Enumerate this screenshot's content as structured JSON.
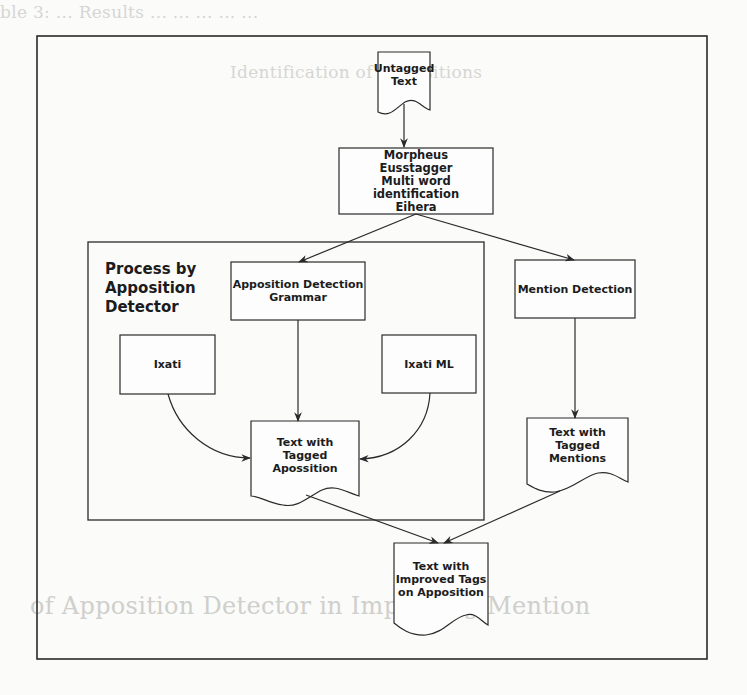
{
  "diagram": {
    "type": "flowchart",
    "nodes": {
      "untagged_text": {
        "shape": "document",
        "label": "Untagged\nText",
        "lines": [
          "Untagged",
          "Text"
        ]
      },
      "preprocessing": {
        "shape": "process",
        "lines": [
          "Morpheus",
          "Eusstagger",
          "Multi word identification",
          "Eihera"
        ]
      },
      "apposition_grammar": {
        "shape": "process",
        "lines": [
          "Apposition Detection",
          "Grammar"
        ]
      },
      "mention_detection": {
        "shape": "process",
        "lines": [
          "Mention Detection"
        ]
      },
      "ixati": {
        "shape": "process",
        "lines": [
          "Ixati"
        ]
      },
      "ixati_ml": {
        "shape": "process",
        "lines": [
          "Ixati ML"
        ]
      },
      "tagged_apposition": {
        "shape": "document",
        "lines": [
          "Text with",
          "Tagged Apossition"
        ]
      },
      "tagged_mentions": {
        "shape": "document",
        "lines": [
          "Text with",
          "Tagged",
          "Mentions"
        ]
      },
      "improved_tags": {
        "shape": "document",
        "lines": [
          "Text with",
          "Improved Tags",
          "on Apposition"
        ]
      }
    },
    "group": {
      "title_lines": [
        "Process by",
        "Apposition",
        "Detector"
      ],
      "contains": [
        "apposition_grammar",
        "ixati",
        "ixati_ml",
        "tagged_apposition"
      ]
    },
    "edges": [
      {
        "from": "untagged_text",
        "to": "preprocessing"
      },
      {
        "from": "preprocessing",
        "to": "apposition_grammar"
      },
      {
        "from": "preprocessing",
        "to": "mention_detection"
      },
      {
        "from": "apposition_grammar",
        "to": "tagged_apposition"
      },
      {
        "from": "ixati",
        "to": "tagged_apposition"
      },
      {
        "from": "ixati_ml",
        "to": "tagged_apposition"
      },
      {
        "from": "mention_detection",
        "to": "tagged_mentions"
      },
      {
        "from": "tagged_apposition",
        "to": "improved_tags"
      },
      {
        "from": "tagged_mentions",
        "to": "improved_tags"
      }
    ]
  },
  "background": {
    "bleed_through_lines": [
      "ble 3: ...  Results  ...  ...  ...  ...  ...",
      "Identification of Appositions",
      "...",
      "of Apposition Detector in Improving Mention",
      "...  ...  ...  ...  ...  ..."
    ]
  },
  "colors": {
    "line": "#2a2a2a",
    "background": "#fbfbfa",
    "text": "#1c1c1c"
  }
}
